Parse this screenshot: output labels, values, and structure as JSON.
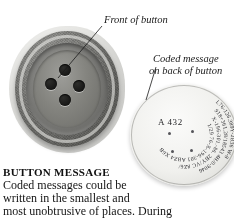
{
  "page": {
    "background_color": "#ffffff",
    "figure_type": "photographic-figure-with-callouts"
  },
  "callouts": [
    {
      "id": "front-of-button",
      "text": "Front of button",
      "style": "italic-serif"
    },
    {
      "id": "coded-message-on-back",
      "line1": "Coded message",
      "line2": "on back of button",
      "style": "italic-serif"
    }
  ],
  "button_photo": {
    "alt_name": "front-of-button-photograph",
    "hole_count": 4,
    "material_color": "#77776f"
  },
  "disc_photo": {
    "alt_name": "back-of-button-coded-message-photograph",
    "center_code": "A 432",
    "disc_color": "#f0f0ed",
    "spiral_code_rings": [
      "L76-126.389Y-2B36 W-8",
      "918+361.28/18543 4H/0-9046",
      "X-196-301.-86. 2BY/VC 8Z6/",
      "1/29 76-X-196-301 ABZ4 X6B",
      "/163 281.-3468-918 WC.A B24 X6B"
    ]
  },
  "caption": {
    "heading": "BUTTON MESSAGE",
    "lines": [
      "Coded messages could be",
      "written in the smallest and",
      "most unobtrusive of places. During"
    ]
  }
}
